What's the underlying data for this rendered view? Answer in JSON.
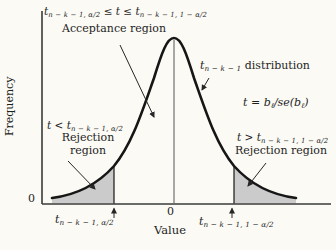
{
  "figure": {
    "background": "#fbfaf5",
    "curve_color": "#161616",
    "axis_color": "#3a3a3a",
    "shade_color": "#cbcbcb",
    "arrow_color": "#262626",
    "thin_line_color": "#555555"
  },
  "y_axis": {
    "label": "Frequency",
    "origin": "0"
  },
  "x_axis": {
    "label": "Value",
    "zero_tick": "0"
  },
  "acceptance": {
    "cond_t1": "t",
    "cond_sub1": "n − k − 1, α/2",
    "cond_mid": " ≤ t ≤ ",
    "cond_t2": "t",
    "cond_sub2": "n − k − 1, 1 − α/2",
    "label": "Acceptance region"
  },
  "distribution": {
    "t": "t",
    "sub": "n − k − 1",
    "label": " distribution"
  },
  "statistic": {
    "pre": "t = b",
    "sub1": "ℓ",
    "mid": "/se(b",
    "sub2": "ℓ",
    "post": ")"
  },
  "rejection_left": {
    "cond_pre": "t < t",
    "cond_sub": "n − k − 1, α/2",
    "label_line1": "Rejection",
    "label_line2": "region"
  },
  "rejection_right": {
    "cond_pre": "t > t",
    "cond_sub": "n − k − 1, 1 − α/2",
    "label": "Rejection region"
  },
  "ticks": {
    "left_t": "t",
    "left_sub": "n − k − 1, α/2",
    "right_t": "t",
    "right_sub": "n − k − 1, 1 − α/2"
  }
}
